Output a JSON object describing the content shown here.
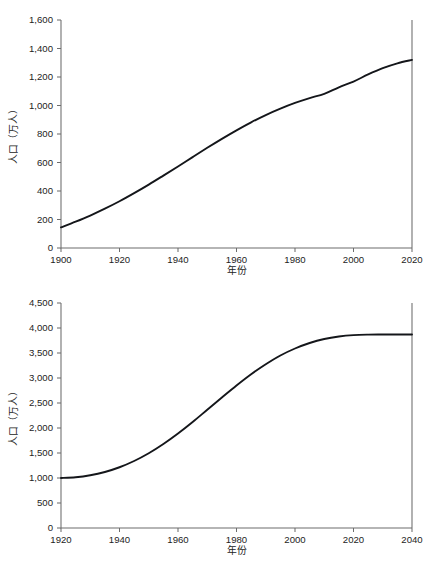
{
  "chart_data": [
    {
      "id": "top",
      "type": "line",
      "title": "",
      "xlabel": "年份",
      "ylabel": "人口（万人）",
      "xlim": [
        1900,
        2020
      ],
      "ylim": [
        0,
        1600
      ],
      "xticks": [
        1900,
        1920,
        1940,
        1960,
        1980,
        2000,
        2020
      ],
      "xtick_labels": [
        "1900",
        "1920",
        "1940",
        "1960",
        "1980",
        "2000",
        "2020"
      ],
      "yticks": [
        0,
        200,
        400,
        600,
        800,
        1000,
        1200,
        1400,
        1600
      ],
      "ytick_labels": [
        "0",
        "200",
        "400",
        "600",
        "800",
        "1,000",
        "1,200",
        "1,400",
        "1,600"
      ],
      "grid": false,
      "legend": "none",
      "series": [
        {
          "name": "人口",
          "x": [
            1900,
            1905,
            1910,
            1915,
            1920,
            1925,
            1930,
            1935,
            1940,
            1945,
            1950,
            1955,
            1960,
            1965,
            1970,
            1975,
            1980,
            1985,
            1990,
            1995,
            2000,
            2005,
            2010,
            2015,
            2020
          ],
          "values": [
            145,
            185,
            228,
            276,
            328,
            385,
            445,
            508,
            572,
            638,
            703,
            766,
            826,
            882,
            933,
            978,
            1018,
            1052,
            1082,
            1128,
            1168,
            1218,
            1262,
            1296,
            1320
          ]
        }
      ]
    },
    {
      "id": "bottom",
      "type": "line",
      "title": "",
      "xlabel": "年份",
      "ylabel": "人口（万人）",
      "xlim": [
        1920,
        2040
      ],
      "ylim": [
        0,
        4500
      ],
      "xticks": [
        1920,
        1940,
        1960,
        1980,
        2000,
        2020,
        2040
      ],
      "xtick_labels": [
        "1920",
        "1940",
        "1960",
        "1980",
        "2000",
        "2020",
        "2040"
      ],
      "yticks": [
        0,
        500,
        1000,
        1500,
        2000,
        2500,
        3000,
        3500,
        4000,
        4500
      ],
      "ytick_labels": [
        "0",
        "500",
        "1,000",
        "1,500",
        "2,000",
        "2,500",
        "3,000",
        "3,500",
        "4,000",
        "4,500"
      ],
      "grid": false,
      "legend": "none",
      "series": [
        {
          "name": "人口",
          "x": [
            1920,
            1925,
            1930,
            1935,
            1940,
            1945,
            1950,
            1955,
            1960,
            1965,
            1970,
            1975,
            1980,
            1985,
            1990,
            1995,
            2000,
            2005,
            2010,
            2015,
            2020,
            2025,
            2030,
            2035,
            2040
          ],
          "values": [
            1000,
            1015,
            1055,
            1120,
            1215,
            1340,
            1495,
            1680,
            1890,
            2120,
            2365,
            2610,
            2850,
            3075,
            3275,
            3450,
            3590,
            3700,
            3780,
            3830,
            3858,
            3868,
            3870,
            3871,
            3871
          ]
        }
      ]
    }
  ]
}
